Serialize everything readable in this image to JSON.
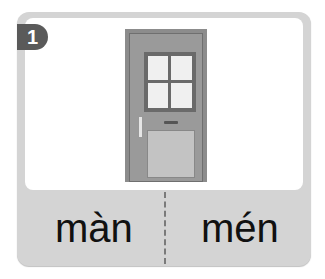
{
  "card": {
    "number": "1",
    "image": "door",
    "choices": [
      {
        "label": "màn"
      },
      {
        "label": "mén"
      }
    ]
  },
  "colors": {
    "card_bg": "#d4d4d4",
    "badge_bg": "#5a5a5a",
    "text": "#111111"
  }
}
